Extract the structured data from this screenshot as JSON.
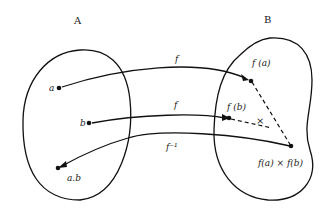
{
  "sets": {
    "A": {
      "label": "A"
    },
    "B": {
      "label": "B"
    }
  },
  "points": {
    "a": "a",
    "b": "b",
    "ab": "a.b",
    "fa": "f (a)",
    "fb": "f (b)",
    "fafb": "f(a) × f(b)"
  },
  "arrows": {
    "f1": "f",
    "f2": "f",
    "finv": "f⁻¹"
  },
  "operation_symbol": "×"
}
